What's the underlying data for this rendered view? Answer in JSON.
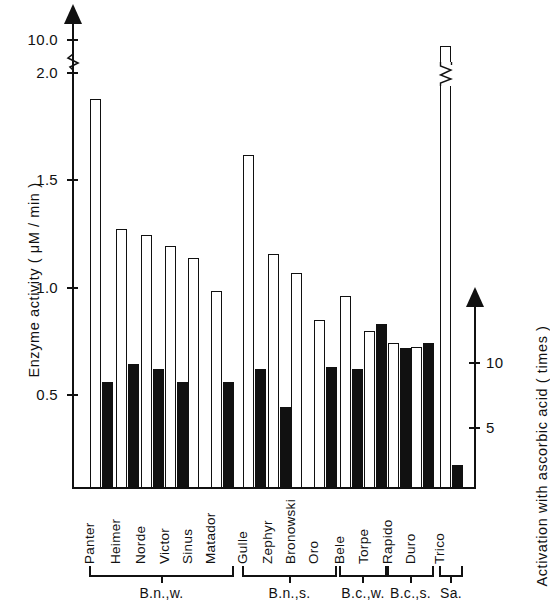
{
  "chart_data": {
    "type": "bar",
    "title": "",
    "categories": [
      "Panter",
      "Heimer",
      "Norde",
      "Victor",
      "Sinus",
      "Matador",
      "Gulle",
      "Zephyr",
      "Bronowski",
      "Oro",
      "Bele",
      "Torpe",
      "Rapido",
      "Duro",
      "Trico"
    ],
    "series": [
      {
        "name": "Enzyme activity",
        "style": "white-open-bar",
        "axis": "left",
        "unit": "μM / min",
        "values": [
          1.88,
          1.25,
          1.22,
          1.17,
          1.11,
          0.95,
          1.61,
          1.13,
          1.04,
          0.81,
          0.93,
          0.76,
          0.7,
          0.68,
          10.0
        ],
        "value_notes": {
          "Trico": "off-scale, axis broken above 2.0"
        }
      },
      {
        "name": "Activation with ascorbic acid",
        "style": "black-filled-bar",
        "axis": "right",
        "unit": "times",
        "values": [
          8.6,
          10.0,
          9.6,
          8.6,
          null,
          8.6,
          9.6,
          6.7,
          null,
          9.8,
          9.6,
          13.1,
          11.2,
          11.6,
          2.2
        ],
        "value_notes": {
          "Sinus": "no bar",
          "Bronowski": "no bar"
        }
      }
    ],
    "left_axis": {
      "label": "Enzyme  activity  ( μM / min )",
      "ticks": [
        {
          "value": "0.5",
          "y": 395
        },
        {
          "value": "1.0",
          "y": 288
        },
        {
          "value": "1.5",
          "y": 180
        },
        {
          "value": "2.0",
          "y": 73
        },
        {
          "value": "10.0",
          "y": 40
        }
      ],
      "broken_between": [
        "2.0",
        "10.0"
      ]
    },
    "right_axis": {
      "label": "Activation  with  ascorbic  acid  ( times )",
      "ticks": [
        {
          "value": "5",
          "y": 428
        },
        {
          "value": "10",
          "y": 363
        }
      ]
    },
    "groups": [
      {
        "label": "B.n.,w.",
        "members": [
          "Panter",
          "Heimer",
          "Norde",
          "Victor",
          "Sinus",
          "Matador"
        ]
      },
      {
        "label": "B.n.,s.",
        "members": [
          "Gulle",
          "Zephyr",
          "Bronowski",
          "Oro"
        ]
      },
      {
        "label": "B.c.,w.",
        "members": [
          "Bele",
          "Torpe"
        ]
      },
      {
        "label": "B.c.,s.",
        "members": [
          "Rapido",
          "Duro"
        ]
      },
      {
        "label": "Sa.",
        "members": [
          "Trico"
        ]
      }
    ],
    "grid": false,
    "legend": "none",
    "colors": {
      "open_bar": "#ffffff",
      "filled_bar": "#111111",
      "axis": "#111111"
    }
  }
}
